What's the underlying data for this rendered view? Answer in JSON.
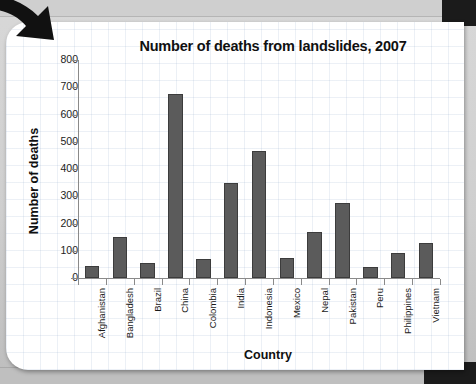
{
  "slide": {
    "arrow_icon": "curved-arrow-icon"
  },
  "chart_data": {
    "type": "bar",
    "title": "Number of deaths from landslides, 2007",
    "xlabel": "Country",
    "ylabel": "Number of deaths",
    "categories": [
      "Afghanistan",
      "Bangladesh",
      "Brazil",
      "China",
      "Colombia",
      "India",
      "Indonesia",
      "Mexico",
      "Nepal",
      "Pakistan",
      "Peru",
      "Philippines",
      "Vietnam"
    ],
    "values": [
      45,
      150,
      55,
      675,
      70,
      350,
      465,
      75,
      170,
      275,
      40,
      90,
      130
    ],
    "ylim": [
      0,
      800
    ],
    "ytick_labels": [
      "0",
      "100",
      "200",
      "300",
      "400",
      "500",
      "600",
      "700",
      "800"
    ],
    "ytick_values": [
      0,
      100,
      200,
      300,
      400,
      500,
      600,
      700,
      800
    ],
    "grid": false,
    "legend": "none",
    "bar_color": "#5b5b5b",
    "bar_edge_color": "#3c3c3c",
    "axis_color": "#8a8a8a",
    "background_color": "#ffffff"
  }
}
